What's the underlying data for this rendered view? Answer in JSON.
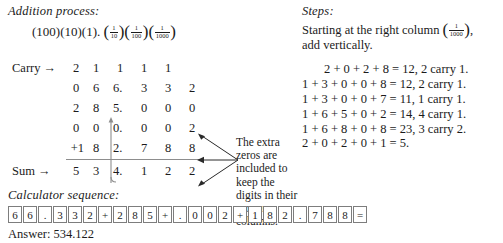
{
  "left": {
    "addition_title": "Addition process:",
    "place_value": {
      "whole": [
        "(100)",
        "(10)",
        "(1)"
      ],
      "separator": ".",
      "fractions": [
        {
          "num": "1",
          "den": "10"
        },
        {
          "num": "1",
          "den": "100"
        },
        {
          "num": "1",
          "den": "1000"
        }
      ]
    },
    "table": {
      "carry_label": "Carry →",
      "sum_label": "Sum →",
      "rows": [
        {
          "name": "carry",
          "label": "Carry →",
          "plus": "",
          "cells": [
            "2",
            "1",
            "1",
            "1",
            "1",
            ""
          ]
        },
        {
          "name": "addend1",
          "label": "",
          "plus": "",
          "cells": [
            "0",
            "6",
            "6.",
            "3",
            "3",
            "2"
          ]
        },
        {
          "name": "addend2",
          "label": "",
          "plus": "",
          "cells": [
            "2",
            "8",
            "5.",
            "0",
            "0",
            "0"
          ]
        },
        {
          "name": "addend3",
          "label": "",
          "plus": "",
          "cells": [
            "0",
            "0",
            "0.",
            "0",
            "0",
            "2"
          ]
        },
        {
          "name": "addend4",
          "label": "",
          "plus": "+1",
          "cells": [
            "",
            "8",
            "2.",
            "7",
            "8",
            "8"
          ]
        },
        {
          "name": "sum",
          "label": "Sum →",
          "plus": "",
          "cells": [
            "5",
            "3",
            "4.",
            "1",
            "2",
            "2"
          ]
        }
      ]
    },
    "extra_zeros_note": "The extra zeros are included to keep the digits in their proper columns.",
    "calculator": {
      "title": "Calculator sequence:",
      "keys": [
        "6",
        "6",
        ".",
        "3",
        "3",
        "2",
        "+",
        "2",
        "8",
        "5",
        "+",
        ".",
        "0",
        "0",
        "2",
        "+",
        "1",
        "8",
        "2",
        ".",
        "7",
        "8",
        "8",
        "="
      ],
      "answer": "Answer: 534.122"
    }
  },
  "right": {
    "steps_title": "Steps:",
    "intro_before": "Starting at the right column",
    "intro_fraction": {
      "num": "1",
      "den": "1000"
    },
    "intro_after": ",",
    "intro_line2": "add vertically.",
    "steps": [
      {
        "indent": true,
        "text": "2 + 0 + 2 + 8 = 12, 2 carry 1."
      },
      {
        "indent": false,
        "text": "1 + 3 + 0 + 0 + 8 = 12, 2 carry 1."
      },
      {
        "indent": false,
        "text": "1 + 3 + 0 + 0 + 7 = 11, 1 carry 1."
      },
      {
        "indent": false,
        "text": "1 + 6 + 5 + 0 + 2 = 14, 4 carry 1."
      },
      {
        "indent": false,
        "text": "1 + 6 + 8 + 0 + 8 = 23, 3 carry 2."
      },
      {
        "indent": false,
        "text": "2 + 0 + 2 + 0 + 1 = 5."
      }
    ]
  },
  "colors": {
    "text": "#1b1b1b",
    "rule": "#8d8d8d",
    "key_border": "#7d7d7d",
    "background": "#ffffff"
  }
}
